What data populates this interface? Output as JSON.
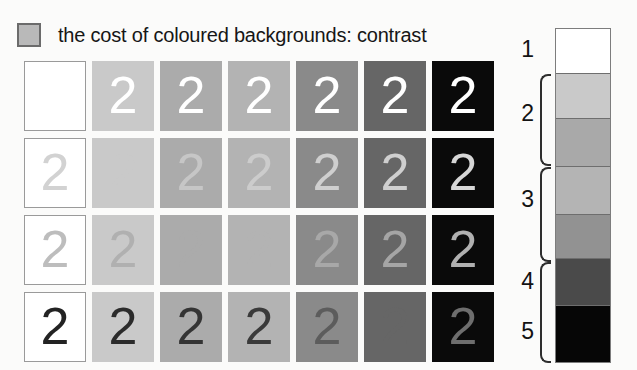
{
  "title": {
    "text": "the cost of coloured backgrounds: contrast",
    "bullet_swatch_color": "#b9b9b9",
    "bullet_swatch_border": "#6b6b6b"
  },
  "grid": {
    "digit": "2",
    "rows": 4,
    "columns": 7,
    "column_backgrounds": [
      "#ffffff",
      "#c9c9c9",
      "#ababab",
      "#b3b3b3",
      "#8a8a8a",
      "#666666",
      "#0a0a0a"
    ],
    "row_digit_colors": [
      "#ffffff",
      "#d2d2d2",
      "#a8a8a8",
      "#2b2b2b"
    ],
    "cells": [
      [
        {
          "bg": "#ffffff",
          "fg": "#ffffff",
          "digit": "2",
          "visible": false,
          "bordered": true
        },
        {
          "bg": "#c9c9c9",
          "fg": "#ffffff",
          "digit": "2",
          "visible": true,
          "bordered": false
        },
        {
          "bg": "#ababab",
          "fg": "#ffffff",
          "digit": "2",
          "visible": true,
          "bordered": false
        },
        {
          "bg": "#b3b3b3",
          "fg": "#ffffff",
          "digit": "2",
          "visible": true,
          "bordered": false
        },
        {
          "bg": "#8a8a8a",
          "fg": "#ffffff",
          "digit": "2",
          "visible": true,
          "bordered": false
        },
        {
          "bg": "#666666",
          "fg": "#ffffff",
          "digit": "2",
          "visible": true,
          "bordered": false
        },
        {
          "bg": "#0a0a0a",
          "fg": "#ffffff",
          "digit": "2",
          "visible": true,
          "bordered": false
        }
      ],
      [
        {
          "bg": "#ffffff",
          "fg": "#d2d2d2",
          "digit": "2",
          "visible": true,
          "bordered": true
        },
        {
          "bg": "#c9c9c9",
          "fg": "#c9c9c9",
          "digit": "2",
          "visible": false,
          "bordered": false
        },
        {
          "bg": "#ababab",
          "fg": "#c6c6c6",
          "digit": "2",
          "visible": true,
          "bordered": false
        },
        {
          "bg": "#b3b3b3",
          "fg": "#cccccc",
          "digit": "2",
          "visible": true,
          "bordered": false
        },
        {
          "bg": "#8a8a8a",
          "fg": "#cfcfcf",
          "digit": "2",
          "visible": true,
          "bordered": false
        },
        {
          "bg": "#666666",
          "fg": "#cfcfcf",
          "digit": "2",
          "visible": true,
          "bordered": false
        },
        {
          "bg": "#0a0a0a",
          "fg": "#d6d6d6",
          "digit": "2",
          "visible": true,
          "bordered": false
        }
      ],
      [
        {
          "bg": "#ffffff",
          "fg": "#bdbdbd",
          "digit": "2",
          "visible": true,
          "bordered": true
        },
        {
          "bg": "#c9c9c9",
          "fg": "#b0b0b0",
          "digit": "2",
          "visible": true,
          "bordered": false
        },
        {
          "bg": "#ababab",
          "fg": "#ababab",
          "digit": "2",
          "visible": false,
          "bordered": false
        },
        {
          "bg": "#b3b3b3",
          "fg": "#b3b3b3",
          "digit": "2",
          "visible": false,
          "bordered": false
        },
        {
          "bg": "#8a8a8a",
          "fg": "#a8a8a8",
          "digit": "2",
          "visible": true,
          "bordered": false
        },
        {
          "bg": "#666666",
          "fg": "#a5a5a5",
          "digit": "2",
          "visible": true,
          "bordered": false
        },
        {
          "bg": "#0a0a0a",
          "fg": "#b0b0b0",
          "digit": "2",
          "visible": true,
          "bordered": false
        }
      ],
      [
        {
          "bg": "#ffffff",
          "fg": "#232323",
          "digit": "2",
          "visible": true,
          "bordered": true
        },
        {
          "bg": "#c9c9c9",
          "fg": "#2b2b2b",
          "digit": "2",
          "visible": true,
          "bordered": false
        },
        {
          "bg": "#ababab",
          "fg": "#343434",
          "digit": "2",
          "visible": true,
          "bordered": false
        },
        {
          "bg": "#b3b3b3",
          "fg": "#3a3a3a",
          "digit": "2",
          "visible": true,
          "bordered": false
        },
        {
          "bg": "#8a8a8a",
          "fg": "#5c5c5c",
          "digit": "2",
          "visible": true,
          "bordered": false
        },
        {
          "bg": "#666666",
          "fg": "#666666",
          "digit": "2",
          "visible": false,
          "bordered": false
        },
        {
          "bg": "#0a0a0a",
          "fg": "#6e6e6e",
          "digit": "2",
          "visible": true,
          "bordered": false
        }
      ]
    ]
  },
  "legend": {
    "bands": [
      {
        "color": "#ffffff",
        "height": 45
      },
      {
        "color": "#c9c9c9",
        "height": 45
      },
      {
        "color": "#a9a9a9",
        "height": 48
      },
      {
        "color": "#b4b4b4",
        "height": 48
      },
      {
        "color": "#929292",
        "height": 45
      },
      {
        "color": "#4a4a4a",
        "height": 47
      },
      {
        "color": "#060606",
        "height": 57
      }
    ],
    "labels": [
      {
        "text": "1",
        "top": 8,
        "braced": false
      },
      {
        "text": "2",
        "top": 72,
        "braced": true,
        "brace_top": 46,
        "brace_height": 92
      },
      {
        "text": "3",
        "top": 158,
        "braced": true,
        "brace_top": 139,
        "brace_height": 95
      },
      {
        "text": "4",
        "top": 240,
        "braced": false
      },
      {
        "text": "5",
        "top": 290,
        "braced": true,
        "brace_top": 234,
        "brace_height": 101
      }
    ]
  }
}
